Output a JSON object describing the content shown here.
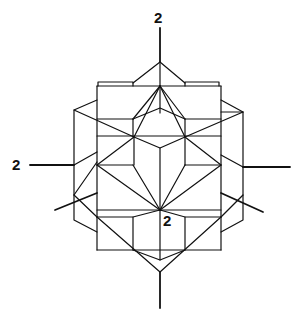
{
  "figure": {
    "type": "crystal-polyhedron-projection",
    "labels": {
      "top_axis": "2",
      "left_axis": "2",
      "center": "2"
    },
    "stroke_color": "#111111",
    "background": "#ffffff"
  }
}
